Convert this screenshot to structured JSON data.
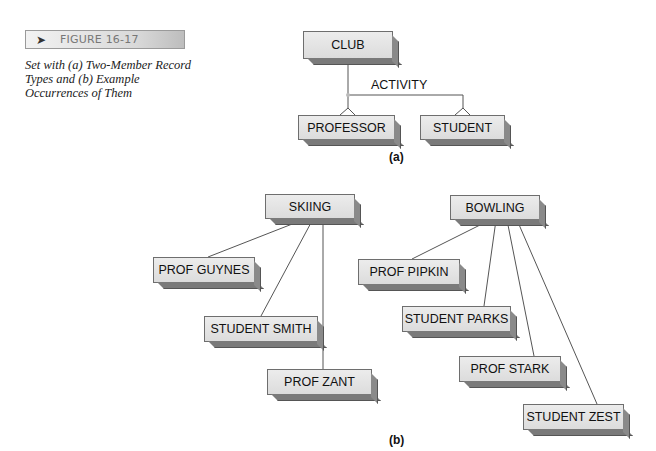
{
  "figure": {
    "label": "FIGURE 16-17",
    "caption": "Set with (a) Two-Member Record Types and (b) Example Occurrences of Them"
  },
  "part_a": {
    "sublabel": "(a)",
    "owner": "CLUB",
    "set_name": "ACTIVITY",
    "members": [
      "PROFESSOR",
      "STUDENT"
    ]
  },
  "part_b": {
    "sublabel": "(b)",
    "occurrences": [
      {
        "owner": "SKIING",
        "members": [
          "PROF GUYNES",
          "STUDENT SMITH",
          "PROF ZANT"
        ]
      },
      {
        "owner": "BOWLING",
        "members": [
          "PROF PIPKIN",
          "STUDENT PARKS",
          "PROF STARK",
          "STUDENT ZEST"
        ]
      }
    ]
  },
  "colors": {
    "box_fill": "#e3e3e3",
    "box_shadow": "#7a7a7a",
    "line": "#555555"
  }
}
